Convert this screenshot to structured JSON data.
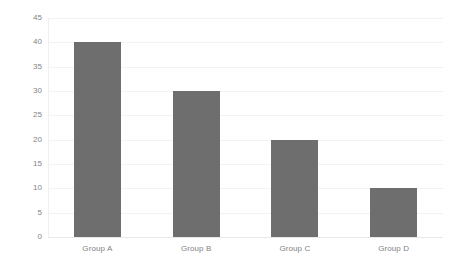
{
  "chart_data": {
    "type": "bar",
    "title": "",
    "subtitle": "",
    "xlabel": "",
    "ylabel": "",
    "categories": [
      "Group A",
      "Group B",
      "Group C",
      "Group D"
    ],
    "values": [
      40,
      30,
      20,
      10
    ],
    "series": [
      {
        "name": "Series 1",
        "values": [
          40,
          30,
          20,
          10
        ]
      }
    ],
    "ylim": [
      0,
      45
    ],
    "ytick_step": 5,
    "yticks": [
      0,
      5,
      10,
      15,
      20,
      25,
      30,
      35,
      40,
      45
    ],
    "ytick_labels": [
      "0",
      "5",
      "10",
      "15",
      "20",
      "25",
      "30",
      "35",
      "40",
      "45"
    ],
    "grid": true,
    "grid_axis": "y",
    "legend": false,
    "legend_position": "none",
    "bar_color": "#6e6e6e",
    "gridline_color": "#f2f2f2",
    "axis_line_color": "#e8e8e8",
    "tick_label_color": "#848484",
    "background_color": "#ffffff",
    "annotations": []
  }
}
